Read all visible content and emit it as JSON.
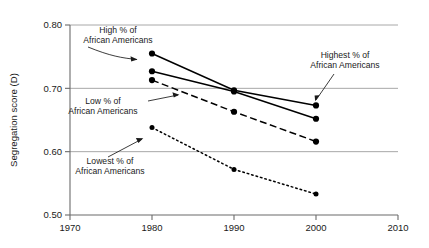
{
  "chart_data": {
    "type": "line",
    "title": "",
    "subtitle": "",
    "xlabel": "",
    "ylabel": "Segregation score (D)",
    "x": [
      1980,
      1990,
      2000
    ],
    "xlim": [
      1970,
      2010
    ],
    "ylim": [
      0.5,
      0.8
    ],
    "xticks": [
      "1970",
      "1980",
      "1990",
      "2000",
      "2010"
    ],
    "xtick_values": [
      1970,
      1980,
      1990,
      2000,
      2010
    ],
    "yticks": [
      "0.50",
      "0.60",
      "0.70",
      "0.80"
    ],
    "ytick_values": [
      0.5,
      0.6,
      0.7,
      0.8
    ],
    "grid": "horizontal",
    "legend_position": "none (inline annotations with arrows)",
    "marker": "filled-circle",
    "series": [
      {
        "name": "Highest % of African Americans",
        "values": [
          0.755,
          0.697,
          0.673
        ],
        "linestyle": "solid",
        "color": "#000000"
      },
      {
        "name": "High % of African Americans",
        "values": [
          0.727,
          0.695,
          0.652
        ],
        "linestyle": "solid",
        "color": "#000000"
      },
      {
        "name": "Low % of African Americans",
        "values": [
          0.713,
          0.663,
          0.616
        ],
        "linestyle": "dashed",
        "color": "#000000"
      },
      {
        "name": "Lowest % of African Americans",
        "values": [
          0.638,
          0.572,
          0.533
        ],
        "linestyle": "dotted",
        "color": "#000000"
      }
    ],
    "annotations": [
      {
        "id": "high",
        "line1": "High % of",
        "line2": "African Americans",
        "points_to_series": "High % of African Americans"
      },
      {
        "id": "highest",
        "line1": "Highest % of",
        "line2": "African Americans",
        "points_to_series": "Highest % of African Americans"
      },
      {
        "id": "low",
        "line1": "Low % of",
        "line2": "African Americans",
        "points_to_series": "Low % of African Americans"
      },
      {
        "id": "lowest",
        "line1": "Lowest % of",
        "line2": "African Americans",
        "points_to_series": "Lowest % of African Americans"
      }
    ],
    "colors": {
      "axis": "#6b6b6b",
      "gridline": "#a8a8a8",
      "data": "#000000",
      "text": "#1a1a1a",
      "background": "#ffffff"
    }
  }
}
